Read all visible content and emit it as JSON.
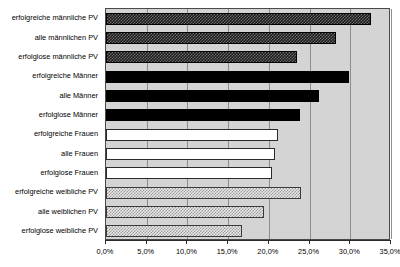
{
  "chart_data": {
    "type": "bar",
    "orientation": "horizontal",
    "title": "",
    "subtitle": "",
    "xlabel": "",
    "ylabel": "",
    "xlim": [
      0,
      35
    ],
    "grid": true,
    "legend": "none",
    "axis": {
      "tick_values": [
        0,
        5,
        10,
        15,
        20,
        25,
        30,
        35
      ],
      "tick_labels": [
        "0,0%",
        "5,0%",
        "10,0%",
        "15,0%",
        "20,0%",
        "25,0%",
        "30,0%",
        "35,0%"
      ]
    },
    "categories": [
      "erfolgreiche männliche PV",
      "alle männlichen PV",
      "erfolglose männliche PV",
      "erfolgreiche Männer",
      "alle Männer",
      "erfolglose Männer",
      "erfolgreiche Frauen",
      "alle Frauen",
      "erfolglose Frauen",
      "erfolgreiche weibliche PV",
      "alle weiblichen PV",
      "erfolglose weibliche PV"
    ],
    "values": [
      32.5,
      28.3,
      23.5,
      29.8,
      26.2,
      23.8,
      21.1,
      20.8,
      20.4,
      23.9,
      19.4,
      16.7
    ],
    "value_labels": [
      "32,5%",
      "28,3%",
      "23,5%",
      "29,8%",
      "26,2%",
      "23,8%",
      "21,1%",
      "20,8%",
      "20,4%",
      "23,9%",
      "19,4%",
      "16,7%"
    ],
    "bar_styles": [
      "dark-hatch",
      "dark-hatch",
      "dark-hatch",
      "solid-black",
      "solid-black",
      "solid-black",
      "white",
      "white",
      "white",
      "light-dots",
      "light-dots",
      "light-dots"
    ]
  },
  "colors": {
    "plot_background": "#d4d4d4",
    "gridline": "#8d8d8d",
    "axis": "#2a2a2a",
    "page_background": "#ffffff",
    "bar_dark": "#1b1b1b",
    "bar_black": "#000000",
    "bar_white": "#ffffff",
    "bar_light": "#e8e8e8"
  }
}
